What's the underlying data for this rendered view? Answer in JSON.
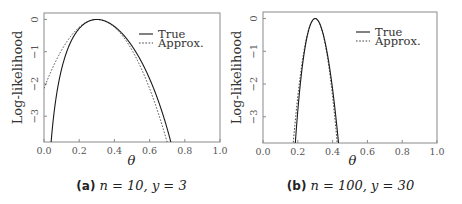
{
  "chart_data": [
    {
      "type": "line",
      "panel_label": "(a)",
      "caption": "n = 10, y = 3",
      "n": 10,
      "y": 3,
      "xlabel": "θ",
      "ylabel": "Log-likelihood",
      "xlim": [
        0.0,
        1.0
      ],
      "ylim": [
        -3.8,
        0.2
      ],
      "xticks": [
        "0.0",
        "0.2",
        "0.4",
        "0.6",
        "0.8",
        "1.0"
      ],
      "yticks": [
        "0",
        "-1",
        "-2",
        "-3"
      ],
      "legend": {
        "position": "upper right",
        "entries": [
          "True",
          "Approx."
        ]
      },
      "series": [
        {
          "name": "True",
          "style": "solid",
          "formula": "y*ln(θ/θhat) + (n-y)*ln((1-θ)/(1-θhat))",
          "points": [
            [
              0.04,
              -3.8
            ],
            [
              0.1,
              -1.57
            ],
            [
              0.2,
              -0.23
            ],
            [
              0.3,
              0
            ],
            [
              0.4,
              -0.23
            ],
            [
              0.5,
              -0.97
            ],
            [
              0.6,
              -2.24
            ],
            [
              0.7,
              -4.23
            ]
          ]
        },
        {
          "name": "Approx.",
          "style": "dotted",
          "formula": "-(θ-θhat)^2 / (2*θhat*(1-θhat)/n)",
          "points": [
            [
              0.0,
              -2.14
            ],
            [
              0.1,
              -0.95
            ],
            [
              0.2,
              -0.24
            ],
            [
              0.3,
              0
            ],
            [
              0.4,
              -0.24
            ],
            [
              0.5,
              -0.95
            ],
            [
              0.6,
              -2.14
            ],
            [
              0.7,
              -3.81
            ]
          ]
        }
      ]
    },
    {
      "type": "line",
      "panel_label": "(b)",
      "caption": "n = 100, y = 30",
      "n": 100,
      "y": 30,
      "xlabel": "θ",
      "ylabel": "Log-likelihood",
      "xlim": [
        0.0,
        1.0
      ],
      "ylim": [
        -3.8,
        0.2
      ],
      "xticks": [
        "0.0",
        "0.2",
        "0.4",
        "0.6",
        "0.8",
        "1.0"
      ],
      "yticks": [
        "0",
        "-1",
        "-2",
        "-3"
      ],
      "legend": {
        "position": "upper right",
        "entries": [
          "True",
          "Approx."
        ]
      },
      "series": [
        {
          "name": "True",
          "style": "solid",
          "points": [
            [
              0.18,
              -3.9
            ],
            [
              0.2,
              -2.56
            ],
            [
              0.25,
              -0.61
            ],
            [
              0.3,
              0
            ],
            [
              0.35,
              -0.58
            ],
            [
              0.4,
              -2.31
            ],
            [
              0.43,
              -3.87
            ]
          ]
        },
        {
          "name": "Approx.",
          "style": "dotted",
          "points": [
            [
              0.17,
              -4.02
            ],
            [
              0.2,
              -2.38
            ],
            [
              0.25,
              -0.6
            ],
            [
              0.3,
              0
            ],
            [
              0.35,
              -0.6
            ],
            [
              0.4,
              -2.38
            ],
            [
              0.43,
              -4.02
            ]
          ]
        }
      ]
    }
  ],
  "panels": [
    {
      "label": "(a)",
      "caption": "n = 10, y = 3",
      "xlabel": "θ",
      "ylabel": "Log-likelihood",
      "legend_true": "True",
      "legend_approx": "Approx."
    },
    {
      "label": "(b)",
      "caption": "n = 100, y = 30",
      "xlabel": "θ",
      "ylabel": "Log-likelihood",
      "legend_true": "True",
      "legend_approx": "Approx."
    }
  ],
  "colors": {
    "axis": "#8a8a8a",
    "true_line": "#1a1a1a",
    "approx_line": "#444444",
    "text": "#555555"
  }
}
